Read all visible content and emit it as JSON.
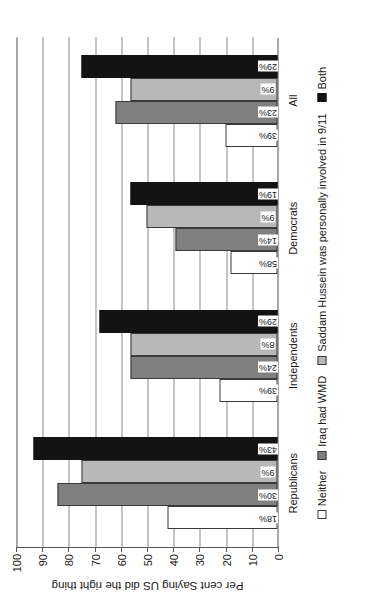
{
  "chart_data": {
    "type": "bar",
    "orientation": "vertical-in-figure-space",
    "title": "",
    "xlabel": "",
    "ylabel": "Per cent Saying US did the right thing",
    "ylim": [
      0,
      100
    ],
    "ytick_labels": [
      "0",
      "10",
      "20",
      "30",
      "40",
      "50",
      "60",
      "70",
      "80",
      "90",
      "100"
    ],
    "ytick_values": [
      0,
      10,
      20,
      30,
      40,
      50,
      60,
      70,
      80,
      90,
      100
    ],
    "grid": true,
    "legend_position": "bottom",
    "categories": [
      "Republicans",
      "Independents",
      "Democrats",
      "All"
    ],
    "series": [
      {
        "name": "Neither",
        "key": "neither",
        "color": "#ffffff",
        "values": [
          42,
          22,
          18,
          20
        ],
        "labels": [
          "18%",
          "39%",
          "58%",
          "39%"
        ]
      },
      {
        "name": "Iraq had WMD",
        "key": "wmd",
        "color": "#808080",
        "values": [
          84,
          56,
          39,
          62
        ],
        "labels": [
          "30%",
          "24%",
          "14%",
          "23%"
        ]
      },
      {
        "name": "Saddam Hussein was personally involved in 9/11",
        "key": "saddam",
        "color": "#b8b8b8",
        "values": [
          75,
          56,
          50,
          56
        ],
        "labels": [
          "9%",
          "8%",
          "9%",
          "9%"
        ]
      },
      {
        "name": "Both",
        "key": "both",
        "color": "#131313",
        "values": [
          93,
          68,
          56,
          75
        ],
        "labels": [
          "43%",
          "29%",
          "19%",
          "29%"
        ]
      }
    ]
  }
}
